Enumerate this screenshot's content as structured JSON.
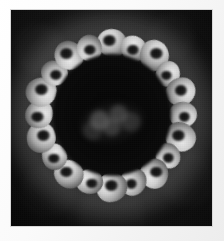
{
  "image": {
    "kind": "grayscale-micrograph",
    "caption": "",
    "alt_text": "Grayscale micrograph of a roughly circular specimen with a bright convoluted lobed rim surrounding a dark interior",
    "width_px": 224,
    "height_px": 241
  },
  "page": {
    "background_color": "#f7f7f7",
    "margin_color": "#fafafa"
  },
  "plate": {
    "label": "photographic plate",
    "left_px": 11,
    "top_px": 10,
    "width_px": 201,
    "height_px": 216,
    "background_color": "#0b0b0b",
    "border_color": "#d8d8d8"
  },
  "specimen": {
    "label": "specimen",
    "shape": "annular",
    "outer_diameter_px": 172,
    "interior_diameter_px": 118,
    "center_x_pct": 50,
    "center_y_pct": 48.5,
    "rim_color_bright": "#e9e9e9",
    "rim_color_mid": "#a8a8a8",
    "interior_color": "#070707",
    "halo_color": "#4a4a4a",
    "nucleus_color": "#6e6e6e",
    "lobe_count": 20
  },
  "rim_lobes": [
    {
      "angle_deg": 0,
      "radius_px": 72,
      "size_px": 30,
      "rot_deg": 12
    },
    {
      "angle_deg": 18,
      "radius_px": 70,
      "size_px": 27,
      "rot_deg": 44
    },
    {
      "angle_deg": 36,
      "radius_px": 73,
      "size_px": 31,
      "rot_deg": 78
    },
    {
      "angle_deg": 54,
      "radius_px": 70,
      "size_px": 26,
      "rot_deg": 105
    },
    {
      "angle_deg": 72,
      "radius_px": 73,
      "size_px": 30,
      "rot_deg": 140
    },
    {
      "angle_deg": 90,
      "radius_px": 71,
      "size_px": 28,
      "rot_deg": 170
    },
    {
      "angle_deg": 108,
      "radius_px": 73,
      "size_px": 31,
      "rot_deg": 200
    },
    {
      "angle_deg": 126,
      "radius_px": 70,
      "size_px": 26,
      "rot_deg": 228
    },
    {
      "angle_deg": 144,
      "radius_px": 73,
      "size_px": 30,
      "rot_deg": 260
    },
    {
      "angle_deg": 162,
      "radius_px": 71,
      "size_px": 28,
      "rot_deg": 292
    },
    {
      "angle_deg": 180,
      "radius_px": 73,
      "size_px": 31,
      "rot_deg": 318
    },
    {
      "angle_deg": 198,
      "radius_px": 70,
      "size_px": 27,
      "rot_deg": 350
    },
    {
      "angle_deg": 216,
      "radius_px": 73,
      "size_px": 30,
      "rot_deg": 24
    },
    {
      "angle_deg": 234,
      "radius_px": 71,
      "size_px": 27,
      "rot_deg": 58
    },
    {
      "angle_deg": 252,
      "radius_px": 74,
      "size_px": 31,
      "rot_deg": 88
    },
    {
      "angle_deg": 270,
      "radius_px": 72,
      "size_px": 29,
      "rot_deg": 122
    },
    {
      "angle_deg": 288,
      "radius_px": 74,
      "size_px": 31,
      "rot_deg": 154
    },
    {
      "angle_deg": 306,
      "radius_px": 71,
      "size_px": 27,
      "rot_deg": 186
    },
    {
      "angle_deg": 324,
      "radius_px": 73,
      "size_px": 30,
      "rot_deg": 214
    },
    {
      "angle_deg": 342,
      "radius_px": 70,
      "size_px": 27,
      "rot_deg": 248
    }
  ]
}
